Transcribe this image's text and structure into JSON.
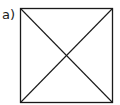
{
  "figure": {
    "label": "a)",
    "shape": "square-with-diagonals",
    "stroke_color": "#1a1a1a",
    "square": {
      "x": 20,
      "y": 8,
      "width": 92,
      "height": 94
    }
  }
}
